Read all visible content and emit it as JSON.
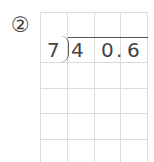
{
  "problem": {
    "number_label": "②",
    "divisor": "7",
    "dividend_digits": [
      "4",
      "0",
      ".",
      "6"
    ]
  }
}
